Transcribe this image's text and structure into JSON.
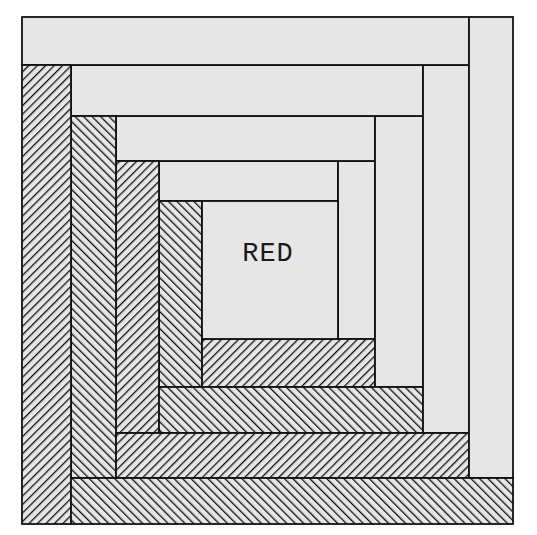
{
  "diagram": {
    "center_label": "RED",
    "colors": {
      "background": "#ffffff",
      "light_fabric": "#e6e6e6",
      "outline": "#111111",
      "hatch": "#111111"
    },
    "center": {
      "x": 202,
      "y": 201,
      "w": 136,
      "h": 138
    },
    "logs": [
      {
        "name": "light-top-1",
        "type": "light",
        "x": 159,
        "y": 161,
        "w": 179,
        "h": 40
      },
      {
        "name": "light-right-1",
        "type": "light",
        "x": 338,
        "y": 161,
        "w": 37,
        "h": 178
      },
      {
        "name": "dark-left-1",
        "type": "dark",
        "hatch": "back",
        "x": 159,
        "y": 201,
        "w": 43,
        "h": 186
      },
      {
        "name": "dark-bottom-1",
        "type": "dark",
        "hatch": "fwd",
        "x": 202,
        "y": 339,
        "w": 173,
        "h": 48
      },
      {
        "name": "light-top-2",
        "type": "light",
        "x": 116,
        "y": 116,
        "w": 259,
        "h": 45
      },
      {
        "name": "light-right-2",
        "type": "light",
        "x": 375,
        "y": 116,
        "w": 48,
        "h": 271
      },
      {
        "name": "dark-left-2",
        "type": "dark",
        "hatch": "fwd",
        "x": 116,
        "y": 161,
        "w": 43,
        "h": 272
      },
      {
        "name": "dark-bottom-2",
        "type": "dark",
        "hatch": "back",
        "x": 159,
        "y": 387,
        "w": 264,
        "h": 46
      },
      {
        "name": "light-top-3",
        "type": "light",
        "x": 71,
        "y": 65,
        "w": 352,
        "h": 51
      },
      {
        "name": "light-right-3",
        "type": "light",
        "x": 423,
        "y": 65,
        "w": 46,
        "h": 368
      },
      {
        "name": "dark-left-3",
        "type": "dark",
        "hatch": "back",
        "x": 71,
        "y": 116,
        "w": 45,
        "h": 362
      },
      {
        "name": "dark-bottom-3",
        "type": "dark",
        "hatch": "fwd",
        "x": 116,
        "y": 433,
        "w": 353,
        "h": 45
      },
      {
        "name": "light-top-4",
        "type": "light",
        "x": 22,
        "y": 17,
        "w": 447,
        "h": 48
      },
      {
        "name": "light-right-4",
        "type": "light",
        "x": 469,
        "y": 17,
        "w": 44,
        "h": 461
      },
      {
        "name": "dark-left-4",
        "type": "dark",
        "hatch": "fwd",
        "x": 22,
        "y": 65,
        "w": 49,
        "h": 459
      },
      {
        "name": "dark-bottom-4",
        "type": "dark",
        "hatch": "back",
        "x": 71,
        "y": 478,
        "w": 442,
        "h": 46
      }
    ]
  }
}
